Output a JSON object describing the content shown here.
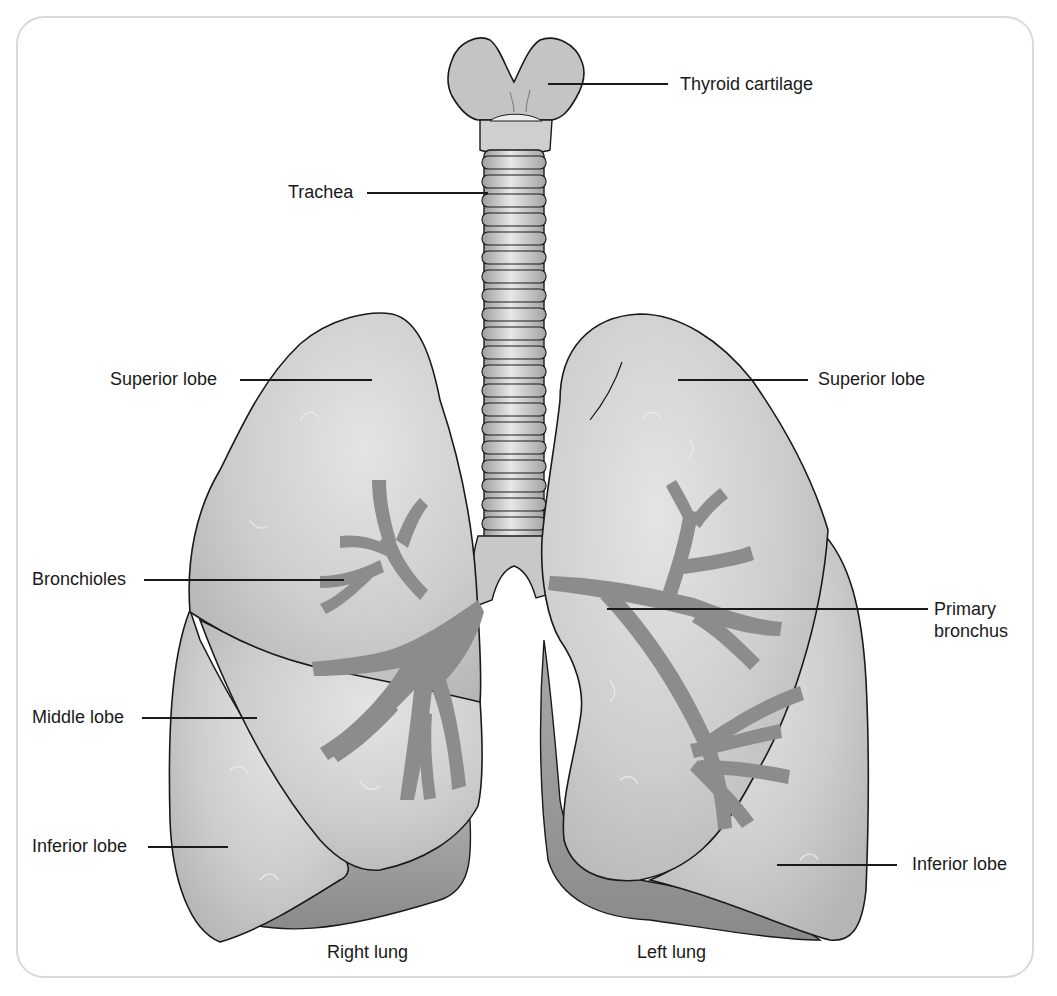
{
  "diagram": {
    "colors": {
      "lung_fill": "#c9c9c9",
      "lung_highlight": "#e6e6e6",
      "lung_shadow": "#9a9a9a",
      "bronchi_fill": "#8c8c8c",
      "outline": "#1a1a1a",
      "frame_border": "#d9d9d9",
      "label_text": "#1a1a1a"
    },
    "labels": {
      "thyroid_cartilage": "Thyroid cartilage",
      "trachea": "Trachea",
      "superior_lobe_right": "Superior lobe",
      "superior_lobe_left": "Superior lobe",
      "bronchioles": "Bronchioles",
      "primary_bronchus_line1": "Primary",
      "primary_bronchus_line2": "bronchus",
      "middle_lobe": "Middle lobe",
      "inferior_lobe_right": "Inferior lobe",
      "inferior_lobe_left": "Inferior lobe",
      "right_lung": "Right lung",
      "left_lung": "Left lung"
    }
  }
}
